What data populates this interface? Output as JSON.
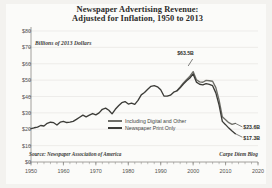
{
  "title": {
    "line1": "Newspaper Advertising Revenue:",
    "line2": "Adjusted for Inflation, 1950 to 2013"
  },
  "axis_subtitle": "Billions of 2013 Dollars",
  "source_note": "Source: Newspaper Association of America",
  "credit_note": "Carpe Diem Blog",
  "legend": {
    "items": [
      {
        "label": "Including Digital and Other",
        "color": "#6e6e68"
      },
      {
        "label": "Newspaper Print Only",
        "color": "#3c3c38"
      }
    ]
  },
  "annotations": {
    "peak": "$63.5B",
    "end_digital": "$23.6B",
    "end_print": "$17.3B"
  },
  "colors": {
    "figure_background": "#f3f2ef",
    "plot_background": "#fbfbf9",
    "gridline": "#e4e3df",
    "axis": "#8d8c87",
    "text": "#3a3a38",
    "line_digital": "#6e6e68",
    "line_print": "#3c3c38"
  },
  "chart_data": {
    "type": "line",
    "title": "Newspaper Advertising Revenue: Adjusted for Inflation, 1950 to 2013",
    "subtitle": "Billions of 2013 Dollars",
    "xlabel": "",
    "ylabel": "Billions of 2013 Dollars",
    "xlim": [
      1950,
      2020
    ],
    "ylim": [
      0,
      80
    ],
    "ytick_labels": [
      "$0",
      "$10",
      "$20",
      "$30",
      "$40",
      "$50",
      "$60",
      "$70",
      "$80"
    ],
    "ytick_values": [
      0,
      10,
      20,
      30,
      40,
      50,
      60,
      70,
      80
    ],
    "xtick_labels": [
      "1950",
      "1960",
      "1970",
      "1980",
      "1990",
      "2000",
      "2010",
      "2020"
    ],
    "xtick_values": [
      1950,
      1960,
      1970,
      1980,
      1990,
      2000,
      2010,
      2020
    ],
    "grid": true,
    "legend_position": "center-right-inside",
    "series": [
      {
        "name": "Newspaper Print Only",
        "color": "#3c3c38",
        "x": [
          1950,
          1951,
          1952,
          1953,
          1954,
          1955,
          1956,
          1957,
          1958,
          1959,
          1960,
          1961,
          1962,
          1963,
          1964,
          1965,
          1966,
          1967,
          1968,
          1969,
          1970,
          1971,
          1972,
          1973,
          1974,
          1975,
          1976,
          1977,
          1978,
          1979,
          1980,
          1981,
          1982,
          1983,
          1984,
          1985,
          1986,
          1987,
          1988,
          1989,
          1990,
          1991,
          1992,
          1993,
          1994,
          1995,
          1996,
          1997,
          1998,
          1999,
          2000,
          2001,
          2002,
          2003,
          2004,
          2005,
          2006,
          2007,
          2008,
          2009,
          2010,
          2011,
          2012,
          2013
        ],
        "values": [
          20.4,
          20.9,
          21.3,
          22.3,
          22.0,
          23.6,
          24.3,
          24.0,
          22.6,
          24.3,
          24.8,
          24.1,
          24.4,
          24.8,
          26.0,
          27.3,
          28.6,
          27.6,
          28.6,
          29.6,
          28.8,
          30.0,
          32.2,
          32.9,
          31.6,
          29.4,
          32.2,
          34.3,
          36.2,
          36.9,
          35.4,
          35.9,
          35.2,
          37.6,
          41.0,
          42.4,
          44.4,
          46.2,
          46.6,
          45.9,
          44.1,
          40.3,
          40.2,
          40.8,
          42.6,
          43.4,
          45.3,
          47.6,
          49.6,
          51.3,
          53.8,
          48.8,
          47.5,
          47.1,
          47.9,
          47.4,
          46.6,
          42.2,
          34.7,
          24.8,
          22.8,
          20.7,
          18.9,
          17.3
        ]
      },
      {
        "name": "Including Digital and Other",
        "color": "#6e6e68",
        "x": [
          1995,
          1996,
          1997,
          1998,
          1999,
          2000,
          2001,
          2002,
          2003,
          2004,
          2005,
          2006,
          2007,
          2008,
          2009,
          2010,
          2011,
          2012,
          2013
        ],
        "values": [
          43.6,
          45.8,
          48.3,
          50.4,
          52.4,
          55.2,
          50.2,
          48.9,
          48.7,
          49.8,
          49.6,
          49.3,
          45.4,
          37.8,
          27.6,
          25.8,
          24.0,
          23.0,
          23.6
        ]
      }
    ],
    "annotations": [
      {
        "text": "$63.5B",
        "x": 2000,
        "y": 63.5
      },
      {
        "text": "$23.6B",
        "x": 2013,
        "y": 23.6
      },
      {
        "text": "$17.3B",
        "x": 2013,
        "y": 17.3
      }
    ]
  }
}
